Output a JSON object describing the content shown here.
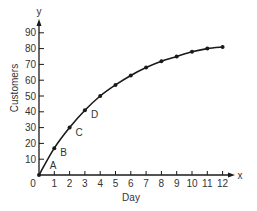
{
  "chart_data": {
    "type": "line",
    "title": "",
    "xlabel": "Day",
    "ylabel": "Customers",
    "x_axis_letter": "x",
    "y_axis_letter": "y",
    "origin_label": "0",
    "xlim": [
      0,
      12
    ],
    "ylim": [
      0,
      90
    ],
    "grid": false,
    "legend": null,
    "x_ticks": [
      "1",
      "2",
      "3",
      "4",
      "5",
      "6",
      "7",
      "8",
      "9",
      "10",
      "11",
      "12"
    ],
    "y_ticks": [
      "10",
      "20",
      "30",
      "40",
      "50",
      "60",
      "70",
      "80",
      "90"
    ],
    "x": [
      0,
      1,
      2,
      3,
      4,
      5,
      6,
      7,
      8,
      9,
      10,
      11,
      12
    ],
    "series": [
      {
        "name": "Customers",
        "values": [
          0,
          17,
          30,
          41,
          50,
          57,
          63,
          68,
          72,
          75,
          78,
          80,
          81
        ]
      }
    ],
    "annotations": [
      {
        "label": "A",
        "x": 0.5,
        "y": 5
      },
      {
        "label": "B",
        "x": 1,
        "y": 17
      },
      {
        "label": "C",
        "x": 2,
        "y": 30
      },
      {
        "label": "D",
        "x": 3,
        "y": 41
      }
    ]
  },
  "colors": {
    "line": "#1a1a1a",
    "text": "#333333",
    "background": "#ffffff"
  }
}
